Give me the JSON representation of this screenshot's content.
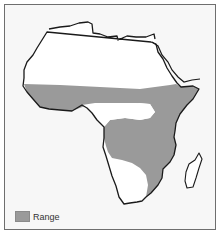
{
  "map": {
    "subject": "Africa range map",
    "colors": {
      "background": "#f7f7f7",
      "land": "#ffffff",
      "coastline": "#1a1a1a",
      "range": "#9a9a9a",
      "frame": "#6e6e6e"
    }
  },
  "legend": {
    "items": [
      {
        "label": "Range",
        "color": "#9a9a9a"
      }
    ]
  }
}
